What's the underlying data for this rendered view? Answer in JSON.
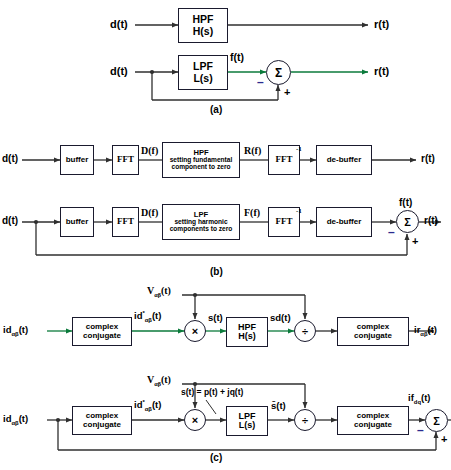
{
  "figure": {
    "panels": [
      "(a)",
      "(b)",
      "(c)"
    ]
  },
  "colors": {
    "wire": "#2f2f2f",
    "green_wire": "#0b7a3b",
    "minus_sign": "#2b2b8f",
    "box_border": "#1a1a2e"
  },
  "panel_a": {
    "label": "(a)",
    "row1": {
      "input": "d(t)",
      "block": {
        "line1": "HPF",
        "line2": "H(s)"
      },
      "output": "r(t)"
    },
    "row2": {
      "input": "d(t)",
      "block": {
        "line1": "LPF",
        "line2": "L(s)"
      },
      "mid_signal": "f(t)",
      "summer": "Σ",
      "minus": "–",
      "plus": "+",
      "output": "r(t)"
    }
  },
  "panel_b": {
    "label": "(b)",
    "row1": {
      "input": "d(t)",
      "buffer": "buffer",
      "fft": "FFT",
      "sig1": "D(f)",
      "filter": {
        "line1": "HPF",
        "line2": "setting fundamental",
        "line3": "component to zero"
      },
      "sig2": "R(f)",
      "ifft": "FFT",
      "ifft_exp": "-1",
      "debuffer": "de-buffer",
      "output": "r(t)"
    },
    "row2": {
      "input": "d(t)",
      "buffer": "buffer",
      "fft": "FFT",
      "sig1": "D(f)",
      "filter": {
        "line1": "LPF",
        "line2": "setting harmonic",
        "line3": "components to zero"
      },
      "sig2": "F(f)",
      "ifft": "FFT",
      "ifft_exp": "-1",
      "debuffer": "de-buffer",
      "mid_signal": "f(t)",
      "summer": "Σ",
      "minus": "–",
      "plus": "+",
      "output": "r(t)"
    }
  },
  "panel_c": {
    "label": "(c)",
    "row1": {
      "input": "idαβ(t)",
      "conj1": {
        "line1": "complex",
        "line2": "conjugate"
      },
      "conj_out": "id*αβ(t)",
      "v_label": "Vαβ(t)",
      "multiply": "×",
      "s_label": "s(t)",
      "filter": {
        "line1": "HPF",
        "line2": "H(s)"
      },
      "sd_label": "sd(t)",
      "divide": "÷",
      "conj2": {
        "line1": "complex",
        "line2": "conjugate"
      },
      "output": "irαβ(t)"
    },
    "row2": {
      "input": "idαβ(t)",
      "conj1": {
        "line1": "complex",
        "line2": "conjugate"
      },
      "conj_out": "id*αβ(t)",
      "v_label": "Vαβ(t)",
      "multiply": "×",
      "s_equation": "s(t) = p(t) + jq(t)",
      "filter": {
        "line1": "LPF",
        "line2": "L(s)"
      },
      "sbar_label": "s̄(t)",
      "divide": "÷",
      "conj2": {
        "line1": "complex",
        "line2": "conjugate"
      },
      "if_label": "ifdq(t)",
      "summer": "Σ",
      "minus": "–",
      "plus": "+",
      "output": "irαβ(t)"
    }
  }
}
